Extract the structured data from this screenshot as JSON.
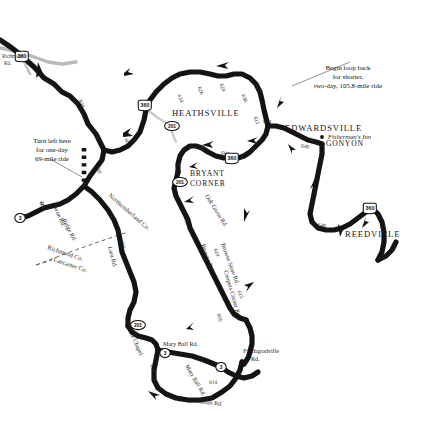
{
  "map": {
    "title": "Northern Neck Virginia Bicycle Route Map",
    "background_color": "#ffffff",
    "road_color": "#141414",
    "county_line_color": "#555555",
    "towns": [
      {
        "name": "HEATHSVILLE",
        "x": 172,
        "y": 116
      },
      {
        "name": "EDWARDSVILLE",
        "x": 285,
        "y": 131
      },
      {
        "name": "GONYON",
        "x": 326,
        "y": 146
      },
      {
        "name": "REEDVILLE",
        "x": 345,
        "y": 237
      },
      {
        "name": "BRYANT",
        "x": 190,
        "y": 176
      },
      {
        "name": "CORNER",
        "x": 190,
        "y": 186
      }
    ],
    "points_of_interest": [
      {
        "name": "Fisherman's Inn",
        "x": 328,
        "y": 139
      }
    ],
    "edge_labels": [
      {
        "text": "Richmond",
        "x": 2,
        "y": 58
      },
      {
        "text": "Rd.",
        "x": 4,
        "y": 65
      }
    ],
    "callouts": [
      {
        "id": "callout-loop-back",
        "lines": [
          "Begin loop back",
          "for shorter,",
          "two-day, 105.8-mile ride"
        ],
        "x": 348,
        "y": 70
      },
      {
        "id": "callout-turn-left",
        "lines": [
          "Turn left here",
          "for one-day",
          "69-mile ride"
        ],
        "x": 52,
        "y": 143
      }
    ],
    "county_labels": [
      {
        "text": "Northumberland Co.",
        "x": 108,
        "y": 196,
        "rotate": 41
      },
      {
        "text": "Richmond Co.",
        "x": 47,
        "y": 249,
        "rotate": 19
      },
      {
        "text": "Lancaster Co.",
        "x": 53,
        "y": 261,
        "rotate": 19
      }
    ],
    "road_name_labels": [
      {
        "text": "Ridge Rd.",
        "x": 62,
        "y": 220,
        "rotate": 62
      },
      {
        "text": "Avon Rd.",
        "x": 53,
        "y": 206,
        "rotate": 66
      },
      {
        "text": "Lara Rd.",
        "x": 108,
        "y": 247,
        "rotate": 75
      },
      {
        "text": "Oak Grove Rd.",
        "x": 205,
        "y": 196,
        "rotate": 58
      },
      {
        "text": "Browns Rd.",
        "x": 201,
        "y": 245,
        "rotate": 70
      },
      {
        "text": "Browns Store Rd.",
        "x": 221,
        "y": 244,
        "rotate": 70
      },
      {
        "text": "Coopers Corner Rd.",
        "x": 224,
        "y": 271,
        "rotate": 74
      },
      {
        "text": "White Chapel",
        "x": 126,
        "y": 325,
        "rotate": 66
      },
      {
        "text": "Mary Ball Rd.",
        "x": 163,
        "y": 346
      },
      {
        "text": "Mary Ball Rd.",
        "x": 185,
        "y": 366,
        "rotate": 60
      },
      {
        "text": "Devils Bottom Rd.",
        "x": 177,
        "y": 401,
        "rotate": 6
      },
      {
        "text": "Pinchgrodville",
        "x": 243,
        "y": 353
      },
      {
        "text": "Rd.",
        "x": 251,
        "y": 361
      }
    ],
    "route_numbers": [
      {
        "num": "600",
        "x": 80,
        "y": 104,
        "rotate": 72
      },
      {
        "num": "604",
        "x": 97,
        "y": 139,
        "rotate": 72
      },
      {
        "num": "601",
        "x": 126,
        "y": 143,
        "rotate": 70
      },
      {
        "num": "600",
        "x": 97,
        "y": 170,
        "rotate": 72
      },
      {
        "num": "600",
        "x": 41,
        "y": 206,
        "rotate": 70
      },
      {
        "num": "601",
        "x": 41,
        "y": 206,
        "rotate": 70
      },
      {
        "num": "600",
        "x": 121,
        "y": 245,
        "rotate": 75
      },
      {
        "num": "634",
        "x": 179,
        "y": 99,
        "rotate": 70
      },
      {
        "num": "626",
        "x": 199,
        "y": 91,
        "rotate": 72
      },
      {
        "num": "629",
        "x": 221,
        "y": 88,
        "rotate": 72
      },
      {
        "num": "636",
        "x": 243,
        "y": 99,
        "rotate": 68
      },
      {
        "num": "611",
        "x": 255,
        "y": 121,
        "rotate": 72
      },
      {
        "num": "604",
        "x": 267,
        "y": 123,
        "rotate": 8
      },
      {
        "num": "604",
        "x": 199,
        "y": 149,
        "rotate": 10
      },
      {
        "num": "604",
        "x": 225,
        "y": 155,
        "rotate": 8
      },
      {
        "num": "646",
        "x": 305,
        "y": 148,
        "rotate": 8
      },
      {
        "num": "646",
        "x": 322,
        "y": 227,
        "rotate": 8
      },
      {
        "num": "692",
        "x": 185,
        "y": 222,
        "rotate": 72
      },
      {
        "num": "610",
        "x": 215,
        "y": 253,
        "rotate": 72
      },
      {
        "num": "615",
        "x": 239,
        "y": 295,
        "rotate": 70
      },
      {
        "num": "605",
        "x": 218,
        "y": 318,
        "rotate": 76
      },
      {
        "num": "604",
        "x": 151,
        "y": 369,
        "rotate": 76
      },
      {
        "num": "614",
        "x": 213,
        "y": 384,
        "rotate": 4
      },
      {
        "num": "614",
        "x": 313,
        "y": 193,
        "rotate": 74
      }
    ],
    "shields": [
      {
        "label": "360",
        "type": "us",
        "x": 22,
        "y": 56
      },
      {
        "label": "360",
        "type": "us",
        "x": 145,
        "y": 105
      },
      {
        "label": "201",
        "type": "state-oval",
        "x": 172,
        "y": 126
      },
      {
        "label": "360",
        "type": "us",
        "x": 232,
        "y": 158
      },
      {
        "label": "201",
        "type": "state-oval",
        "x": 180,
        "y": 182
      },
      {
        "label": "360",
        "type": "us",
        "x": 370,
        "y": 208
      },
      {
        "label": "3",
        "type": "state-oval",
        "x": 20,
        "y": 218
      },
      {
        "label": "201",
        "type": "state-oval",
        "x": 138,
        "y": 325
      },
      {
        "label": "3",
        "type": "state-oval",
        "x": 165,
        "y": 353
      },
      {
        "label": "3",
        "type": "state-oval",
        "x": 221,
        "y": 367
      }
    ],
    "legend": {
      "route_color": "#141414",
      "dotted_segment_note": "dotted alternate segment"
    }
  }
}
